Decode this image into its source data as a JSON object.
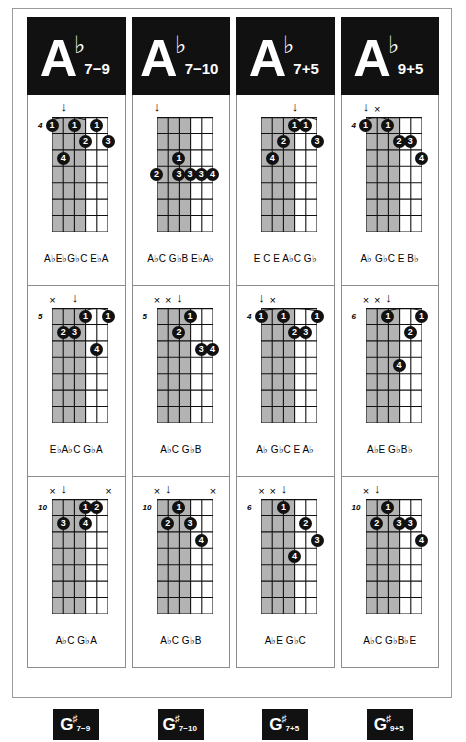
{
  "colors": {
    "ink": "#111111",
    "paper": "#ffffff",
    "shade": "#b3b3b3",
    "rule": "#8c8c8c"
  },
  "columns": [
    {
      "header": {
        "root": "A",
        "accidental": "♭",
        "sub": "7−9"
      },
      "footer": {
        "root": "G",
        "accidental": "♯",
        "sub": "7−9"
      },
      "diagrams": [
        {
          "fret": "4",
          "top_marks": [
            {
              "sym": "↓",
              "string": 2
            }
          ],
          "shade_strings": [
            1,
            2,
            3,
            4
          ],
          "barre": {
            "fret": 1,
            "from": 1,
            "to": 4
          },
          "dots": [
            {
              "string": 1,
              "fret": 1,
              "finger": "1"
            },
            {
              "string": 3,
              "fret": 1,
              "finger": "1"
            },
            {
              "string": 5,
              "fret": 1,
              "finger": "1"
            },
            {
              "string": 4,
              "fret": 2,
              "finger": "2"
            },
            {
              "string": 6,
              "fret": 2,
              "finger": "3"
            },
            {
              "string": 2,
              "fret": 3,
              "finger": "4"
            }
          ],
          "notes": "A♭E♭G♭C E♭A"
        },
        {
          "fret": "5",
          "top_marks": [
            {
              "sym": "×",
              "string": 1
            },
            {
              "sym": "↓",
              "string": 3
            }
          ],
          "shade_strings": [
            1,
            2,
            3,
            4
          ],
          "barre": {
            "fret": 1,
            "from": 4,
            "to": 6
          },
          "dots": [
            {
              "string": 4,
              "fret": 1,
              "finger": "1"
            },
            {
              "string": 6,
              "fret": 1,
              "finger": "1"
            },
            {
              "string": 2,
              "fret": 2,
              "finger": "2"
            },
            {
              "string": 3,
              "fret": 2,
              "finger": "3"
            },
            {
              "string": 5,
              "fret": 3,
              "finger": "4"
            }
          ],
          "notes": "E♭A♭C G♭A"
        },
        {
          "fret": "10",
          "top_marks": [
            {
              "sym": "×",
              "string": 1
            },
            {
              "sym": "↓",
              "string": 2
            },
            {
              "sym": "×",
              "string": 6
            }
          ],
          "shade_strings": [
            1,
            2,
            3,
            4
          ],
          "barre": null,
          "dots": [
            {
              "string": 4,
              "fret": 1,
              "finger": "1"
            },
            {
              "string": 5,
              "fret": 1,
              "finger": "2"
            },
            {
              "string": 2,
              "fret": 2,
              "finger": "3"
            },
            {
              "string": 4,
              "fret": 2,
              "finger": "4"
            }
          ],
          "notes": "A♭C G♭A"
        }
      ]
    },
    {
      "header": {
        "root": "A",
        "accidental": "♭",
        "sub": "7−10"
      },
      "footer": {
        "root": "G",
        "accidental": "♯",
        "sub": "7−10"
      },
      "diagrams": [
        {
          "fret": "",
          "top_marks": [
            {
              "sym": "↓",
              "string": 1
            }
          ],
          "shade_strings": [
            1,
            2,
            3,
            4
          ],
          "barre": null,
          "dots": [
            {
              "string": 3,
              "fret": 3,
              "finger": "1"
            },
            {
              "string": 1,
              "fret": 4,
              "finger": "2"
            },
            {
              "string": 3,
              "fret": 4,
              "finger": "3"
            },
            {
              "string": 4,
              "fret": 4,
              "finger": "3"
            },
            {
              "string": 5,
              "fret": 4,
              "finger": "3"
            },
            {
              "string": 6,
              "fret": 4,
              "finger": "4"
            }
          ],
          "notes": "A♭C G♭B E♭A♭"
        },
        {
          "fret": "5",
          "top_marks": [
            {
              "sym": "×",
              "string": 1
            },
            {
              "sym": "×",
              "string": 2
            },
            {
              "sym": "↓",
              "string": 3
            }
          ],
          "shade_strings": [
            1,
            2,
            3,
            4
          ],
          "barre": null,
          "dots": [
            {
              "string": 4,
              "fret": 1,
              "finger": "1"
            },
            {
              "string": 3,
              "fret": 2,
              "finger": "2"
            },
            {
              "string": 5,
              "fret": 3,
              "finger": "3"
            },
            {
              "string": 6,
              "fret": 3,
              "finger": "4"
            }
          ],
          "notes": "A♭C G♭B"
        },
        {
          "fret": "10",
          "top_marks": [
            {
              "sym": "×",
              "string": 1
            },
            {
              "sym": "↓",
              "string": 2
            },
            {
              "sym": "×",
              "string": 6
            }
          ],
          "shade_strings": [
            1,
            2,
            3,
            4
          ],
          "barre": null,
          "dots": [
            {
              "string": 3,
              "fret": 1,
              "finger": "1"
            },
            {
              "string": 2,
              "fret": 2,
              "finger": "2"
            },
            {
              "string": 4,
              "fret": 2,
              "finger": "3"
            },
            {
              "string": 5,
              "fret": 3,
              "finger": "4"
            }
          ],
          "notes": "A♭C G♭B"
        }
      ]
    },
    {
      "header": {
        "root": "A",
        "accidental": "♭",
        "sub": "7+5"
      },
      "footer": {
        "root": "G",
        "accidental": "♯",
        "sub": "7+5"
      },
      "diagrams": [
        {
          "fret": "",
          "top_marks": [
            {
              "sym": "↓",
              "string": 4
            }
          ],
          "shade_strings": [
            1,
            2,
            3,
            4
          ],
          "barre": {
            "fret": 1,
            "from": 4,
            "to": 6
          },
          "dots": [
            {
              "string": 4,
              "fret": 1,
              "finger": "1"
            },
            {
              "string": 5,
              "fret": 1,
              "finger": "1"
            },
            {
              "string": 3,
              "fret": 2,
              "finger": "2"
            },
            {
              "string": 6,
              "fret": 2,
              "finger": "3"
            },
            {
              "string": 2,
              "fret": 3,
              "finger": "4"
            }
          ],
          "notes": "E C E A♭C G♭"
        },
        {
          "fret": "4",
          "top_marks": [
            {
              "sym": "↓",
              "string": 1
            },
            {
              "sym": "×",
              "string": 2
            }
          ],
          "shade_strings": [
            1,
            2,
            3,
            4
          ],
          "barre": {
            "fret": 1,
            "from": 1,
            "to": 6
          },
          "dots": [
            {
              "string": 1,
              "fret": 1,
              "finger": "1"
            },
            {
              "string": 3,
              "fret": 1,
              "finger": "1"
            },
            {
              "string": 6,
              "fret": 1,
              "finger": "1"
            },
            {
              "string": 4,
              "fret": 2,
              "finger": "2"
            },
            {
              "string": 5,
              "fret": 2,
              "finger": "3"
            }
          ],
          "notes": "A♭ G♭C E A♭"
        },
        {
          "fret": "6",
          "top_marks": [
            {
              "sym": "×",
              "string": 1
            },
            {
              "sym": "×",
              "string": 2
            },
            {
              "sym": "↓",
              "string": 3
            }
          ],
          "shade_strings": [
            1,
            2,
            3,
            4
          ],
          "barre": null,
          "dots": [
            {
              "string": 3,
              "fret": 1,
              "finger": "1"
            },
            {
              "string": 5,
              "fret": 2,
              "finger": "2"
            },
            {
              "string": 6,
              "fret": 3,
              "finger": "3"
            },
            {
              "string": 4,
              "fret": 4,
              "finger": "4"
            }
          ],
          "notes": "A♭E G♭C"
        }
      ]
    },
    {
      "header": {
        "root": "A",
        "accidental": "♭",
        "sub": "9+5"
      },
      "footer": {
        "root": "G",
        "accidental": "♯",
        "sub": "9+5"
      },
      "diagrams": [
        {
          "fret": "4",
          "top_marks": [
            {
              "sym": "↓",
              "string": 1
            },
            {
              "sym": "×",
              "string": 2
            }
          ],
          "shade_strings": [
            1,
            2,
            3,
            4
          ],
          "barre": {
            "fret": 1,
            "from": 1,
            "to": 3
          },
          "dots": [
            {
              "string": 1,
              "fret": 1,
              "finger": "1"
            },
            {
              "string": 3,
              "fret": 1,
              "finger": "1"
            },
            {
              "string": 4,
              "fret": 2,
              "finger": "2"
            },
            {
              "string": 5,
              "fret": 2,
              "finger": "3"
            },
            {
              "string": 6,
              "fret": 3,
              "finger": "4"
            }
          ],
          "notes": "A♭  G♭C E B♭"
        },
        {
          "fret": "6",
          "top_marks": [
            {
              "sym": "×",
              "string": 1
            },
            {
              "sym": "×",
              "string": 2
            },
            {
              "sym": "↓",
              "string": 3
            }
          ],
          "shade_strings": [
            1,
            2,
            3,
            4
          ],
          "barre": {
            "fret": 1,
            "from": 3,
            "to": 6
          },
          "dots": [
            {
              "string": 3,
              "fret": 1,
              "finger": "1"
            },
            {
              "string": 6,
              "fret": 1,
              "finger": "1"
            },
            {
              "string": 5,
              "fret": 2,
              "finger": "2"
            },
            {
              "string": 4,
              "fret": 4,
              "finger": "4"
            }
          ],
          "notes": "A♭E G♭B♭"
        },
        {
          "fret": "10",
          "top_marks": [
            {
              "sym": "×",
              "string": 1
            },
            {
              "sym": "↓",
              "string": 2
            }
          ],
          "shade_strings": [
            1,
            2,
            3,
            4
          ],
          "barre": null,
          "dots": [
            {
              "string": 3,
              "fret": 1,
              "finger": "1"
            },
            {
              "string": 2,
              "fret": 2,
              "finger": "2"
            },
            {
              "string": 4,
              "fret": 2,
              "finger": "3"
            },
            {
              "string": 5,
              "fret": 2,
              "finger": "3"
            },
            {
              "string": 6,
              "fret": 3,
              "finger": "4"
            }
          ],
          "notes": "A♭C G♭B♭E"
        }
      ]
    }
  ]
}
